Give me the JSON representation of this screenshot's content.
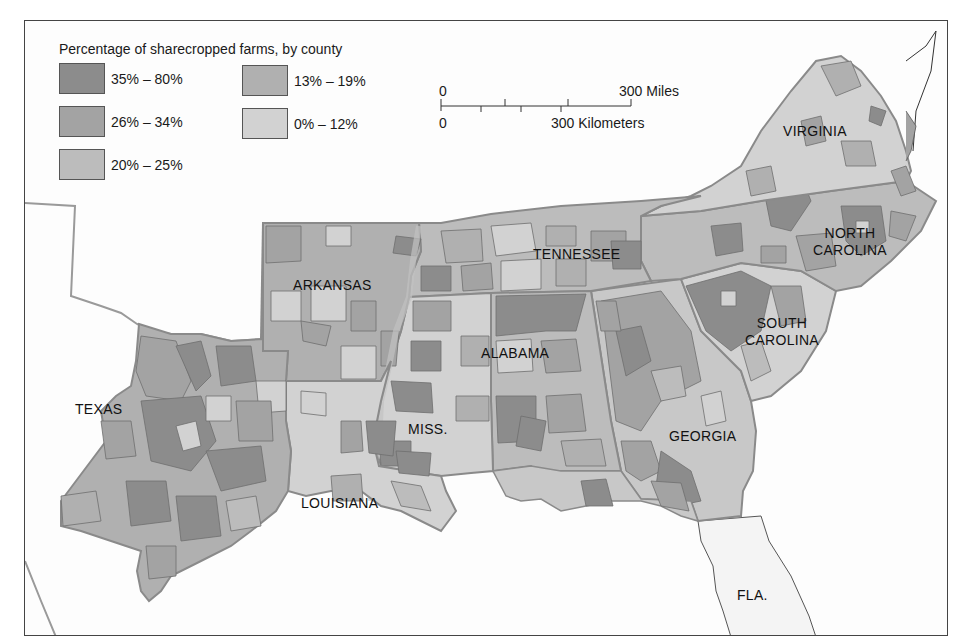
{
  "map": {
    "title": "Percentage of sharecropped farms, by county",
    "legend": {
      "title": "Percentage of sharecropped farms, by county",
      "items": [
        {
          "label": "35% – 80%",
          "color": "#8c8c8c"
        },
        {
          "label": "26% – 34%",
          "color": "#a3a3a3"
        },
        {
          "label": "20% – 25%",
          "color": "#bcbcbc"
        },
        {
          "label": "13% – 19%",
          "color": "#b0b0b0"
        },
        {
          "label": "0% – 12%",
          "color": "#d2d2d2"
        }
      ]
    },
    "scale_bar": {
      "miles_start": "0",
      "miles_end": "300 Miles",
      "km_start": "0",
      "km_end": "300 Kilometers"
    },
    "states": [
      {
        "name": "VIRGINIA"
      },
      {
        "name": "NORTH\nCAROLINA",
        "line1": "NORTH",
        "line2": "CAROLINA"
      },
      {
        "name": "TENNESSEE"
      },
      {
        "name": "ARKANSAS"
      },
      {
        "name": "SOUTH\nCAROLINA",
        "line1": "SOUTH",
        "line2": "CAROLINA"
      },
      {
        "name": "ALABAMA"
      },
      {
        "name": "TEXAS"
      },
      {
        "name": "MISS."
      },
      {
        "name": "GEORGIA"
      },
      {
        "name": "LOUISIANA"
      },
      {
        "name": "FLA."
      }
    ],
    "colors": {
      "frame_border": "#444444",
      "state_border": "#8a8a8a",
      "county_border": "#6e6e6e",
      "water": "#ffffff",
      "unshaded_land": "#f6f6f6",
      "florida": "#f4f4f4"
    }
  }
}
